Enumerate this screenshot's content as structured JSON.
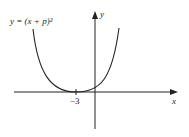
{
  "diagram": {
    "equation_label": "y = (x + p)²",
    "x_axis_label": "x",
    "y_axis_label": "y",
    "vertex_tick_label": "−3",
    "curve": "parabola",
    "vertex_x": -3,
    "vertex_y": 0,
    "colors": {
      "stroke": "#222222",
      "background": "#ffffff"
    }
  }
}
